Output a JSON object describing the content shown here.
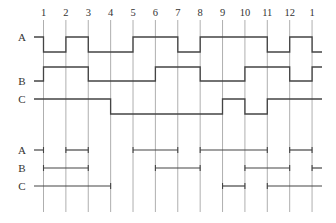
{
  "diagram": {
    "type": "timing-diagram",
    "clock_ticks": [
      "1",
      "2",
      "3",
      "4",
      "5",
      "6",
      "7",
      "8",
      "9",
      "10",
      "11",
      "12",
      "1"
    ],
    "waveforms": [
      {
        "name": "A",
        "initial": 1,
        "final_after_last_tick": 0,
        "levels_per_interval": [
          1,
          0,
          1,
          0,
          0,
          1,
          1,
          0,
          1,
          1,
          1,
          0,
          1,
          0
        ]
      },
      {
        "name": "B",
        "initial": 0,
        "levels_per_interval": [
          0,
          1,
          1,
          0,
          0,
          0,
          1,
          1,
          0,
          0,
          1,
          1,
          0,
          1
        ]
      },
      {
        "name": "C",
        "initial": 1,
        "levels_per_interval": [
          1,
          1,
          1,
          1,
          0,
          0,
          0,
          0,
          0,
          1,
          0,
          1,
          1,
          1
        ]
      }
    ],
    "interval_bars": [
      {
        "name": "A",
        "intervals": [
          [
            "start",
            "1"
          ],
          [
            "2",
            "3"
          ],
          [
            "5",
            "7"
          ],
          [
            "8",
            "11"
          ],
          [
            "12",
            "1"
          ]
        ]
      },
      {
        "name": "B",
        "intervals": [
          [
            "1",
            "3"
          ],
          [
            "6",
            "8"
          ],
          [
            "10",
            "12"
          ],
          [
            "1",
            "end"
          ]
        ]
      },
      {
        "name": "C",
        "intervals": [
          [
            "start",
            "4"
          ],
          [
            "9",
            "10"
          ],
          [
            "11",
            "end"
          ]
        ]
      }
    ],
    "interval_bar_indices": [
      {
        "name": "A",
        "spans": [
          [
            -1,
            0
          ],
          [
            1,
            2
          ],
          [
            4,
            6
          ],
          [
            7,
            10
          ],
          [
            11,
            12
          ]
        ]
      },
      {
        "name": "B",
        "spans": [
          [
            0,
            2
          ],
          [
            5,
            7
          ],
          [
            9,
            11
          ],
          [
            12,
            13
          ]
        ]
      },
      {
        "name": "C",
        "spans": [
          [
            -1,
            3
          ],
          [
            8,
            9
          ],
          [
            10,
            13
          ]
        ]
      }
    ]
  }
}
